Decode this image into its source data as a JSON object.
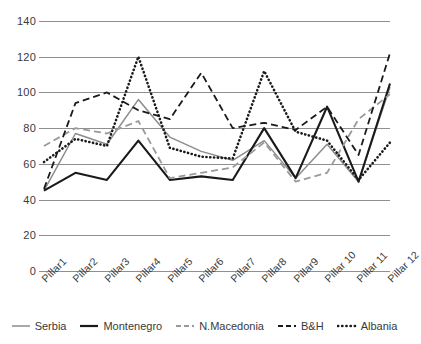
{
  "chart_data": {
    "type": "line",
    "title": "",
    "xlabel": "",
    "ylabel": "",
    "ylim": [
      0,
      140
    ],
    "ytick_step": 20,
    "yticks": [
      "0",
      "20",
      "40",
      "60",
      "80",
      "100",
      "120",
      "140"
    ],
    "grid": true,
    "legend_position": "bottom",
    "categories": [
      "Pillar1",
      "Pillar2",
      "Pillar3",
      "Pillar4",
      "Pillar5",
      "Pillar6",
      "Pillar7",
      "Pillar8",
      "Pillar9",
      "Pillar 10",
      "Pillar 11",
      "Pillar 12"
    ],
    "series": [
      {
        "name": "Serbia",
        "color": "#8c8c8c",
        "style": "solid",
        "values": [
          45,
          77,
          71,
          96,
          75,
          67,
          62,
          73,
          52,
          71,
          50,
          103
        ]
      },
      {
        "name": "Montenegro",
        "color": "#1a1a1a",
        "style": "solid",
        "values": [
          45,
          55,
          51,
          73,
          51,
          53,
          51,
          80,
          52,
          92,
          50,
          105
        ]
      },
      {
        "name": "N.Macedonia",
        "color": "#9a9a9a",
        "style": "dashed",
        "values": [
          70,
          80,
          77,
          84,
          52,
          55,
          58,
          72,
          50,
          55,
          85,
          99
        ]
      },
      {
        "name": "B&H",
        "color": "#1a1a1a",
        "style": "dashed",
        "values": [
          46,
          94,
          100,
          90,
          85,
          111,
          80,
          83,
          79,
          92,
          65,
          122
        ]
      },
      {
        "name": "Albania",
        "color": "#1a1a1a",
        "style": "dotted",
        "values": [
          61,
          74,
          70,
          120,
          69,
          64,
          63,
          112,
          78,
          73,
          51,
          72
        ]
      }
    ]
  },
  "legend": {
    "items": [
      {
        "label": "Serbia"
      },
      {
        "label": "Montenegro"
      },
      {
        "label": "N.Macedonia"
      },
      {
        "label": "B&H"
      },
      {
        "label": "Albania"
      }
    ]
  }
}
